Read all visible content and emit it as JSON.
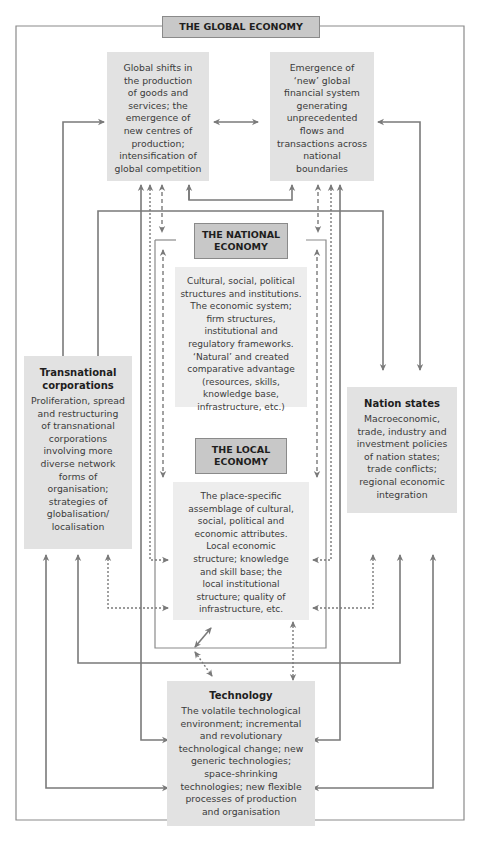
{
  "diagram": {
    "global_header": "THE GLOBAL ECONOMY",
    "national_header": "THE NATIONAL\nECONOMY",
    "local_header": "THE LOCAL\nECONOMY",
    "global_production": {
      "body": "Global shifts in\nthe production\nof goods and\nservices; the\nemergence of\nnew centres of\nproduction;\nintensification of\nglobal competition"
    },
    "global_finance": {
      "body": "Emergence of\n‘new’ global\nfinancial system\ngenerating\nunprecedented\nflows and\ntransactions across\nnational\nboundaries"
    },
    "national_content": {
      "body": "Cultural, social, political\nstructures and institutions.\nThe economic system;\nfirm structures,\ninstitutional and\nregulatory frameworks.\n‘Natural’ and created\ncomparative advantage\n(resources, skills,\nknowledge base,\ninfrastructure, etc.)"
    },
    "local_content": {
      "body": "The place-specific\nassemblage of cultural,\nsocial, political and\neconomic attributes.\nLocal economic\nstructure; knowledge\nand skill base; the\nlocal institutional\nstructure; quality of\ninfrastructure, etc."
    },
    "transnational": {
      "title": "Transnational\ncorporations",
      "body": "Proliferation, spread\nand restructuring\nof transnational\ncorporations\ninvolving more\ndiverse network\nforms of\norganisation;\nstrategies of\nglobalisation/\nlocalisation"
    },
    "nation_states": {
      "title": "Nation states",
      "body": "Macroeconomic,\ntrade, industry and\ninvestment policies\nof nation states;\ntrade conflicts;\nregional economic\nintegration"
    },
    "technology": {
      "title": "Technology",
      "body": "The volatile technological\nenvironment; incremental\nand revolutionary\ntechnological change; new\ngeneric technologies;\nspace-shrinking\ntechnologies; new flexible\nprocesses of production\nand organisation"
    },
    "colors": {
      "line": "#7a7a7a",
      "box_fill": "#e2e2e2",
      "box_fill_light": "#ededed",
      "header_fill": "#c8c8c8",
      "frame": "#8a8a8a"
    }
  }
}
